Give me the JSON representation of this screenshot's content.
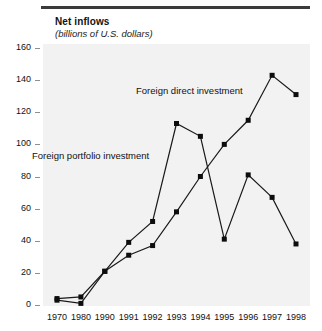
{
  "chart_data": {
    "type": "line",
    "title": "Net inflows",
    "subtitle": "(billions of U.S. dollars)",
    "xlabel": "",
    "ylabel": "",
    "categories": [
      "1970",
      "1980",
      "1990",
      "1991",
      "1992",
      "1993",
      "1994",
      "1995",
      "1996",
      "1997",
      "1998"
    ],
    "ylim": [
      0,
      160
    ],
    "yticks": [
      0,
      20,
      40,
      60,
      80,
      100,
      120,
      140,
      160
    ],
    "grid": false,
    "legend_position": "inline-annotation",
    "marker": "square",
    "series": [
      {
        "name": "Foreign direct investment",
        "values": [
          4,
          5,
          21,
          31,
          37,
          58,
          80,
          100,
          115,
          143,
          131
        ]
      },
      {
        "name": "Foreign portfolio investment",
        "values": [
          3,
          1,
          21,
          39,
          52,
          113,
          105,
          41,
          81,
          67,
          38
        ]
      }
    ],
    "annotations": [
      {
        "text": "Foreign direct investment",
        "x": "1992",
        "y": 128
      },
      {
        "text": "Foreign portfolio investment",
        "x": "1970",
        "y": 88
      }
    ]
  },
  "axes": {
    "y_tick_labels": [
      "160",
      "140",
      "120",
      "100",
      "80",
      "60",
      "40",
      "20",
      "0"
    ],
    "x_tick_labels": [
      "1970",
      "1980",
      "1990",
      "1991",
      "1992",
      "1993",
      "1994",
      "1995",
      "1996",
      "1997",
      "1998"
    ]
  },
  "colors": {
    "rule": "#3b3b3b",
    "plot_background": "#f2f2f2",
    "series_line": "#1a1a1a",
    "marker": "#0d0d0d",
    "text": "#111111"
  }
}
